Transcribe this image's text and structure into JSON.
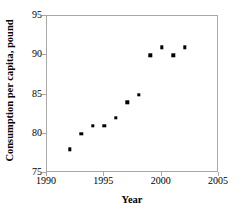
{
  "chart_data": {
    "type": "scatter",
    "title": "",
    "xlabel": "Year",
    "ylabel": "Consumption per capita, pound",
    "xlim": [
      1990,
      2005
    ],
    "ylim": [
      75,
      95
    ],
    "xticks": [
      1990,
      1995,
      2000,
      2005
    ],
    "yticks": [
      75,
      80,
      85,
      90,
      95
    ],
    "xtick_labels": [
      "1990",
      "1995",
      "2000",
      "2005"
    ],
    "ytick_labels": [
      "75",
      "80",
      "85",
      "90",
      "95"
    ],
    "grid": false,
    "legend": null,
    "marker": "square",
    "marker_color": "#000000",
    "frame_color": "#a8a8a8",
    "background": "#ffffff",
    "x": [
      1992,
      1993,
      1994,
      1995,
      1996,
      1997,
      1998,
      1999,
      2000,
      2001,
      2002
    ],
    "values": [
      78,
      80,
      81,
      81,
      82,
      84,
      85,
      90,
      91,
      90,
      91
    ],
    "points": [
      {
        "x": 1992,
        "y": 78
      },
      {
        "x": 1993,
        "y": 80
      },
      {
        "x": 1994,
        "y": 81
      },
      {
        "x": 1995,
        "y": 81
      },
      {
        "x": 1996,
        "y": 82
      },
      {
        "x": 1997,
        "y": 84
      },
      {
        "x": 1998,
        "y": 85
      },
      {
        "x": 1999,
        "y": 90
      },
      {
        "x": 2000,
        "y": 91
      },
      {
        "x": 2001,
        "y": 90
      },
      {
        "x": 2002,
        "y": 91
      }
    ]
  }
}
